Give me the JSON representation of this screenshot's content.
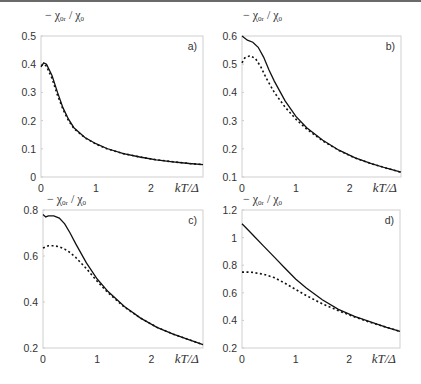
{
  "figure": {
    "y_axis_label": "− χ₀ᵣ / χ₀",
    "x_axis_label": "kT/Δ"
  },
  "chart_data": [
    {
      "type": "line",
      "panel": "a)",
      "xlabel": "kT/Δ",
      "ylabel": "− χ0r / χ0",
      "xlim": [
        0,
        2.95
      ],
      "ylim": [
        0,
        0.5
      ],
      "xticks": [
        "0",
        "1",
        "2"
      ],
      "yticks": [
        "0",
        "0.1",
        "0.2",
        "0.3",
        "0.4",
        "0.5"
      ],
      "grid": false,
      "series": [
        {
          "name": "solid",
          "style": "solid",
          "x": [
            0,
            0.05,
            0.1,
            0.2,
            0.3,
            0.4,
            0.5,
            0.6,
            0.8,
            1.0,
            1.2,
            1.5,
            1.8,
            2.1,
            2.4,
            2.7,
            2.95
          ],
          "y": [
            0.39,
            0.405,
            0.4,
            0.36,
            0.3,
            0.245,
            0.205,
            0.175,
            0.14,
            0.118,
            0.101,
            0.083,
            0.071,
            0.061,
            0.054,
            0.048,
            0.044
          ]
        },
        {
          "name": "dotted",
          "style": "dotted",
          "x": [
            0,
            0.05,
            0.1,
            0.2,
            0.3,
            0.4,
            0.5,
            0.6,
            0.8,
            1.0,
            1.2,
            1.5,
            1.8,
            2.1,
            2.4,
            2.7,
            2.95
          ],
          "y": [
            0.395,
            0.4,
            0.393,
            0.35,
            0.29,
            0.24,
            0.2,
            0.172,
            0.139,
            0.117,
            0.1,
            0.083,
            0.071,
            0.061,
            0.054,
            0.048,
            0.044
          ]
        }
      ]
    },
    {
      "type": "line",
      "panel": "b)",
      "xlabel": "kT/Δ",
      "ylabel": "− χ0r / χ0",
      "xlim": [
        0,
        2.95
      ],
      "ylim": [
        0.1,
        0.6
      ],
      "xticks": [
        "0",
        "1",
        "2"
      ],
      "yticks": [
        "0.1",
        "0.2",
        "0.3",
        "0.4",
        "0.5",
        "0.6"
      ],
      "grid": false,
      "series": [
        {
          "name": "solid",
          "style": "solid",
          "x": [
            0,
            0.1,
            0.2,
            0.3,
            0.4,
            0.5,
            0.6,
            0.8,
            1.0,
            1.2,
            1.5,
            1.8,
            2.1,
            2.4,
            2.7,
            2.95
          ],
          "y": [
            0.6,
            0.585,
            0.578,
            0.56,
            0.525,
            0.48,
            0.44,
            0.37,
            0.315,
            0.275,
            0.23,
            0.195,
            0.168,
            0.147,
            0.13,
            0.117
          ]
        },
        {
          "name": "dotted",
          "style": "dotted",
          "x": [
            0,
            0.05,
            0.15,
            0.25,
            0.35,
            0.45,
            0.6,
            0.8,
            1.0,
            1.2,
            1.5,
            1.8,
            2.1,
            2.4,
            2.7,
            2.95
          ],
          "y": [
            0.505,
            0.522,
            0.53,
            0.52,
            0.49,
            0.45,
            0.4,
            0.348,
            0.305,
            0.27,
            0.228,
            0.194,
            0.167,
            0.147,
            0.13,
            0.117
          ]
        }
      ]
    },
    {
      "type": "line",
      "panel": "c)",
      "xlabel": "kT/Δ",
      "ylabel": "− χ0r / χ0",
      "xlim": [
        0,
        2.95
      ],
      "ylim": [
        0.2,
        0.8
      ],
      "xticks": [
        "0",
        "1",
        "2"
      ],
      "yticks": [
        "0.2",
        "0.4",
        "0.6",
        "0.8"
      ],
      "grid": false,
      "series": [
        {
          "name": "solid",
          "style": "solid",
          "x": [
            0,
            0.05,
            0.1,
            0.2,
            0.3,
            0.4,
            0.5,
            0.6,
            0.8,
            1.0,
            1.2,
            1.5,
            1.8,
            2.1,
            2.4,
            2.7,
            2.95
          ],
          "y": [
            0.78,
            0.77,
            0.775,
            0.775,
            0.765,
            0.74,
            0.7,
            0.655,
            0.57,
            0.5,
            0.445,
            0.38,
            0.33,
            0.29,
            0.26,
            0.235,
            0.215
          ]
        },
        {
          "name": "dotted",
          "style": "dotted",
          "x": [
            0,
            0.1,
            0.2,
            0.3,
            0.4,
            0.5,
            0.6,
            0.8,
            1.0,
            1.2,
            1.5,
            1.8,
            2.1,
            2.4,
            2.7,
            2.95
          ],
          "y": [
            0.635,
            0.645,
            0.645,
            0.64,
            0.63,
            0.615,
            0.595,
            0.545,
            0.49,
            0.44,
            0.378,
            0.33,
            0.29,
            0.26,
            0.235,
            0.215
          ]
        }
      ]
    },
    {
      "type": "line",
      "panel": "d)",
      "xlabel": "kT/Δ",
      "ylabel": "− χ0r / χ0",
      "xlim": [
        0,
        2.95
      ],
      "ylim": [
        0.2,
        1.2
      ],
      "xticks": [
        "0",
        "1",
        "2"
      ],
      "yticks": [
        "0.2",
        "0.4",
        "0.6",
        "0.8",
        "1",
        "1.2"
      ],
      "grid": false,
      "series": [
        {
          "name": "solid",
          "style": "solid",
          "x": [
            0,
            0.1,
            0.2,
            0.4,
            0.6,
            0.8,
            1.0,
            1.2,
            1.5,
            1.8,
            2.1,
            2.4,
            2.7,
            2.95
          ],
          "y": [
            1.1,
            1.06,
            1.02,
            0.94,
            0.86,
            0.78,
            0.7,
            0.635,
            0.55,
            0.48,
            0.43,
            0.39,
            0.35,
            0.32
          ]
        },
        {
          "name": "dotted",
          "style": "dotted",
          "x": [
            0,
            0.1,
            0.2,
            0.4,
            0.6,
            0.8,
            1.0,
            1.2,
            1.5,
            1.8,
            2.1,
            2.4,
            2.7,
            2.95
          ],
          "y": [
            0.75,
            0.75,
            0.748,
            0.735,
            0.71,
            0.67,
            0.625,
            0.58,
            0.52,
            0.47,
            0.425,
            0.385,
            0.35,
            0.32
          ]
        }
      ]
    }
  ]
}
